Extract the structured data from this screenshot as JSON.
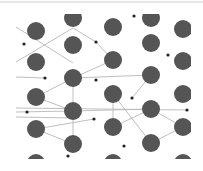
{
  "diagram": {
    "colors": {
      "atom": "#555555",
      "dot": "#222222",
      "bond": "#b8b8b8",
      "background": "#ffffff"
    },
    "clip": {
      "x": 16,
      "y": 14,
      "width": 175,
      "height": 145
    },
    "atom_radius": 9,
    "dot_radius": 1.6,
    "atoms": [
      {
        "x": 36,
        "y": 31
      },
      {
        "x": 36,
        "y": 62
      },
      {
        "x": 36,
        "y": 97
      },
      {
        "x": 36,
        "y": 129
      },
      {
        "x": 36,
        "y": 163
      },
      {
        "x": 73,
        "y": 18
      },
      {
        "x": 73,
        "y": 45
      },
      {
        "x": 73,
        "y": 78
      },
      {
        "x": 73,
        "y": 111
      },
      {
        "x": 73,
        "y": 144
      },
      {
        "x": 113,
        "y": 27
      },
      {
        "x": 113,
        "y": 60
      },
      {
        "x": 113,
        "y": 94
      },
      {
        "x": 113,
        "y": 127
      },
      {
        "x": 113,
        "y": 163
      },
      {
        "x": 151,
        "y": 18
      },
      {
        "x": 151,
        "y": 43
      },
      {
        "x": 151,
        "y": 75
      },
      {
        "x": 151,
        "y": 109
      },
      {
        "x": 151,
        "y": 143
      },
      {
        "x": 183,
        "y": 29
      },
      {
        "x": 183,
        "y": 61
      },
      {
        "x": 183,
        "y": 94
      },
      {
        "x": 183,
        "y": 127
      },
      {
        "x": 183,
        "y": 163
      }
    ],
    "dots": [
      {
        "x": 24,
        "y": 44
      },
      {
        "x": 45,
        "y": 78
      },
      {
        "x": 27,
        "y": 112
      },
      {
        "x": 96,
        "y": 42
      },
      {
        "x": 96,
        "y": 80
      },
      {
        "x": 94,
        "y": 119
      },
      {
        "x": 68,
        "y": 156
      },
      {
        "x": 134,
        "y": 16
      },
      {
        "x": 132,
        "y": 98
      },
      {
        "x": 124,
        "y": 146
      },
      {
        "x": 168,
        "y": 55
      },
      {
        "x": 187,
        "y": 110
      }
    ],
    "bonds": [
      [
        16,
        27,
        73,
        63
      ],
      [
        16,
        62,
        73,
        28
      ],
      [
        73,
        28,
        96,
        42
      ],
      [
        96,
        42,
        113,
        60
      ],
      [
        73,
        78,
        113,
        60
      ],
      [
        16,
        77,
        45,
        78
      ],
      [
        73,
        78,
        151,
        75
      ],
      [
        151,
        75,
        132,
        98
      ],
      [
        36,
        97,
        73,
        78
      ],
      [
        36,
        97,
        73,
        111
      ],
      [
        73,
        78,
        73,
        111
      ],
      [
        16,
        108,
        187,
        110
      ],
      [
        16,
        112,
        73,
        111
      ],
      [
        16,
        117,
        73,
        118
      ],
      [
        73,
        111,
        151,
        109
      ],
      [
        36,
        129,
        94,
        119
      ],
      [
        36,
        129,
        73,
        144
      ],
      [
        73,
        111,
        73,
        144
      ],
      [
        113,
        94,
        151,
        143
      ],
      [
        113,
        94,
        113,
        127
      ],
      [
        113,
        127,
        151,
        109
      ],
      [
        151,
        109,
        183,
        127
      ],
      [
        151,
        143,
        183,
        127
      ],
      [
        113,
        127,
        118,
        127
      ]
    ]
  }
}
